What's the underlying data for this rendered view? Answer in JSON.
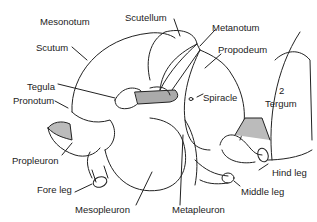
{
  "diagram": {
    "labels": {
      "mesonotum": "Mesonotum",
      "scutellum": "Scutellum",
      "metanotum": "Metanotum",
      "scutum": "Scutum",
      "propodeum": "Propodeum",
      "tegula": "Tegula",
      "pronotum": "Pronotum",
      "spiracle": "Spiracle",
      "tergum_number": "2",
      "tergum": "Tergum",
      "propleuron": "Propleuron",
      "hind_leg": "Hind leg",
      "fore_leg": "Fore leg",
      "middle_leg": "Middle leg",
      "mesopleuron": "Mesopleuron",
      "metapleuron": "Metapleuron"
    },
    "colors": {
      "line": "#222222",
      "shading": "#9a9a9a",
      "background": "#ffffff"
    }
  }
}
